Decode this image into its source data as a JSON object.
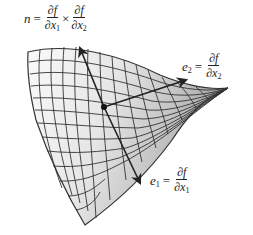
{
  "diagram": {
    "labels": {
      "normal": {
        "lhs": "n",
        "eq": "=",
        "num1": "∂f",
        "den1_var": "∂x",
        "den1_sub": "1",
        "times": "×",
        "num2": "∂f",
        "den2_var": "∂x",
        "den2_sub": "2"
      },
      "e2": {
        "lhs_var": "e",
        "lhs_sub": "2",
        "eq": "=",
        "num": "∂f",
        "den_var": "∂x",
        "den_sub": "2"
      },
      "e1": {
        "lhs_var": "e",
        "lhs_sub": "1",
        "eq": "=",
        "num": "∂f",
        "den_var": "∂x",
        "den_sub": "1"
      }
    },
    "nodes": [
      {
        "id": "point",
        "label": "surface point",
        "x": 104,
        "y": 107
      },
      {
        "id": "n_tip",
        "label": "normal vector n",
        "x": 80,
        "y": 48
      },
      {
        "id": "e2_tip",
        "label": "tangent e2",
        "x": 185,
        "y": 80
      },
      {
        "id": "e1_tip",
        "label": "tangent e1",
        "x": 140,
        "y": 183
      }
    ],
    "edges": [
      {
        "from": "point",
        "to": "n_tip",
        "label": "n"
      },
      {
        "from": "point",
        "to": "e2_tip",
        "label": "e2"
      },
      {
        "from": "point",
        "to": "e1_tip",
        "label": "e1"
      }
    ],
    "colors": {
      "grid": "#333333",
      "surface_light": "#f4f4f4",
      "surface_dark": "#b8b8b8",
      "arrow": "#222222"
    }
  }
}
